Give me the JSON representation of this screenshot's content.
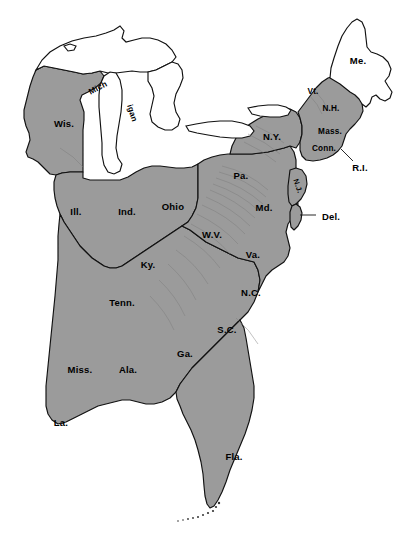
{
  "map": {
    "title": "Eastern United States",
    "background_color": "#ffffff",
    "shaded_fill": "#9b9b9b",
    "unshaded_fill": "#ffffff",
    "outline_color": "#111111",
    "ridge_color": "#7b7b7b",
    "width": 410,
    "height": 542,
    "regions": [
      {
        "id": "wisconsin",
        "label": "Wis.",
        "x": 64,
        "y": 123,
        "shaded": true,
        "rotation": 0,
        "size": "normal"
      },
      {
        "id": "michigan-upper",
        "label": "Mich",
        "x": 98,
        "y": 88,
        "shaded": true,
        "rotation": -28,
        "size": "sm"
      },
      {
        "id": "michigan-lower",
        "label": "igan",
        "x": 132,
        "y": 113,
        "shaded": true,
        "rotation": 72,
        "size": "sm"
      },
      {
        "id": "illinois",
        "label": "Ill.",
        "x": 76,
        "y": 211,
        "shaded": true,
        "rotation": 0,
        "size": "normal"
      },
      {
        "id": "indiana",
        "label": "Ind.",
        "x": 127,
        "y": 211,
        "shaded": true,
        "rotation": 0,
        "size": "normal"
      },
      {
        "id": "ohio",
        "label": "Ohio",
        "x": 173,
        "y": 206,
        "shaded": true,
        "rotation": 0,
        "size": "normal"
      },
      {
        "id": "kentucky",
        "label": "Ky.",
        "x": 148,
        "y": 264,
        "shaded": true,
        "rotation": 0,
        "size": "normal"
      },
      {
        "id": "tennessee",
        "label": "Tenn.",
        "x": 122,
        "y": 302,
        "shaded": true,
        "rotation": 0,
        "size": "normal"
      },
      {
        "id": "mississippi",
        "label": "Miss.",
        "x": 80,
        "y": 369,
        "shaded": true,
        "rotation": 0,
        "size": "normal"
      },
      {
        "id": "alabama",
        "label": "Ala.",
        "x": 128,
        "y": 369,
        "shaded": true,
        "rotation": 0,
        "size": "normal"
      },
      {
        "id": "georgia",
        "label": "Ga.",
        "x": 185,
        "y": 353,
        "shaded": true,
        "rotation": 0,
        "size": "normal"
      },
      {
        "id": "louisiana",
        "label": "La.",
        "x": 61,
        "y": 422,
        "shaded": true,
        "rotation": 0,
        "size": "normal"
      },
      {
        "id": "florida",
        "label": "Fla.",
        "x": 234,
        "y": 456,
        "shaded": true,
        "rotation": 0,
        "size": "normal"
      },
      {
        "id": "south-carolina",
        "label": "S.C.",
        "x": 227,
        "y": 329,
        "shaded": true,
        "rotation": 0,
        "size": "normal"
      },
      {
        "id": "north-carolina",
        "label": "N.C.",
        "x": 251,
        "y": 292,
        "shaded": true,
        "rotation": 0,
        "size": "normal"
      },
      {
        "id": "virginia",
        "label": "Va.",
        "x": 253,
        "y": 254,
        "shaded": true,
        "rotation": 0,
        "size": "normal"
      },
      {
        "id": "west-virginia",
        "label": "W.V.",
        "x": 212,
        "y": 234,
        "shaded": true,
        "rotation": 0,
        "size": "normal"
      },
      {
        "id": "maryland",
        "label": "Md.",
        "x": 264,
        "y": 207,
        "shaded": true,
        "rotation": 0,
        "size": "normal"
      },
      {
        "id": "pennsylvania",
        "label": "Pa.",
        "x": 241,
        "y": 175,
        "shaded": true,
        "rotation": 0,
        "size": "normal"
      },
      {
        "id": "new-york",
        "label": "N.Y.",
        "x": 272,
        "y": 136,
        "shaded": true,
        "rotation": 0,
        "size": "normal"
      },
      {
        "id": "new-jersey",
        "label": "N.J.",
        "x": 298,
        "y": 186,
        "shaded": true,
        "rotation": 70,
        "size": "xs"
      },
      {
        "id": "delaware",
        "label": "Del.",
        "x": 331,
        "y": 216,
        "shaded": true,
        "rotation": 0,
        "size": "normal"
      },
      {
        "id": "vermont",
        "label": "Vt.",
        "x": 313,
        "y": 91,
        "shaded": true,
        "rotation": 0,
        "size": "sm"
      },
      {
        "id": "new-hampshire",
        "label": "N.H.",
        "x": 331,
        "y": 108,
        "shaded": true,
        "rotation": 0,
        "size": "sm"
      },
      {
        "id": "massachusetts",
        "label": "Mass.",
        "x": 330,
        "y": 131,
        "shaded": true,
        "rotation": 0,
        "size": "sm"
      },
      {
        "id": "connecticut",
        "label": "Conn.",
        "x": 324,
        "y": 148,
        "shaded": true,
        "rotation": 0,
        "size": "sm"
      },
      {
        "id": "rhode-island",
        "label": "R.I.",
        "x": 360,
        "y": 167,
        "shaded": true,
        "rotation": 0,
        "size": "normal"
      },
      {
        "id": "maine",
        "label": "Me.",
        "x": 358,
        "y": 60,
        "shaded": false,
        "rotation": 0,
        "size": "normal"
      }
    ],
    "callouts": [
      {
        "id": "delaware-leader",
        "label": "Del."
      },
      {
        "id": "rhode-island-leader",
        "label": "R.I."
      }
    ],
    "water_bodies": [
      {
        "id": "lake-superior"
      },
      {
        "id": "lake-michigan"
      },
      {
        "id": "lake-huron"
      },
      {
        "id": "lake-erie"
      },
      {
        "id": "lake-ontario"
      }
    ],
    "features": [
      {
        "id": "appalachian-ridges"
      },
      {
        "id": "florida-keys"
      }
    ]
  }
}
